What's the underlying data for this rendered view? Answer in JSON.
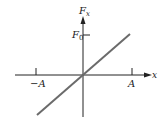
{
  "diagram": {
    "y_axis_label": "F",
    "y_axis_sub": "x",
    "x_axis_label": "x",
    "f0_label": "F",
    "f0_sub": "0",
    "neg_a_label": "−A",
    "pos_a_label": "A",
    "line_color": "#6b6b6b",
    "axis_color": "#222222"
  }
}
